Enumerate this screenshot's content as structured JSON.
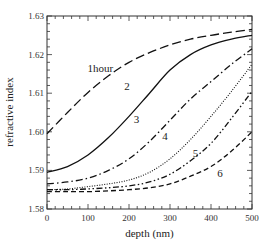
{
  "chart_data": {
    "type": "line",
    "title": "",
    "xlabel": "depth (nm)",
    "ylabel": "refractive index",
    "xlim": [
      0,
      500
    ],
    "ylim": [
      1.58,
      1.63
    ],
    "xticks": [
      0,
      100,
      200,
      300,
      400,
      500
    ],
    "yticks": [
      1.58,
      1.59,
      1.6,
      1.61,
      1.62,
      1.63
    ],
    "ytick_labels": [
      "1.58",
      "1.59",
      "1.60",
      "1.61",
      "1.62",
      "1.63"
    ],
    "xtick_labels": [
      "0",
      "100",
      "200",
      "300",
      "400",
      "500"
    ],
    "grid": false,
    "legend": "inline curve labels",
    "x": [
      0,
      50,
      100,
      150,
      200,
      250,
      300,
      350,
      400,
      450,
      500
    ],
    "series": [
      {
        "name": "1hour",
        "label": "1hour",
        "style": "long-dash",
        "values": [
          1.5995,
          1.605,
          1.6102,
          1.6145,
          1.618,
          1.6205,
          1.6225,
          1.624,
          1.625,
          1.6258,
          1.6265
        ]
      },
      {
        "name": "2",
        "label": "2",
        "style": "solid",
        "values": [
          1.5895,
          1.591,
          1.594,
          1.5985,
          1.604,
          1.61,
          1.616,
          1.62,
          1.6225,
          1.624,
          1.625
        ]
      },
      {
        "name": "3",
        "label": "3",
        "style": "dash-dot",
        "values": [
          1.5865,
          1.587,
          1.588,
          1.59,
          1.593,
          1.5975,
          1.603,
          1.6085,
          1.613,
          1.6175,
          1.6215
        ]
      },
      {
        "name": "4",
        "label": "4",
        "style": "dotted",
        "values": [
          1.585,
          1.5852,
          1.5858,
          1.5865,
          1.5875,
          1.5895,
          1.593,
          1.598,
          1.604,
          1.6105,
          1.6175
        ]
      },
      {
        "name": "5",
        "label": "5",
        "style": "dash-dot-dot",
        "values": [
          1.585,
          1.585,
          1.5852,
          1.5855,
          1.586,
          1.587,
          1.589,
          1.5925,
          1.597,
          1.6035,
          1.6105
        ]
      },
      {
        "name": "6",
        "label": "6",
        "style": "short-dash",
        "values": [
          1.5845,
          1.5845,
          1.5845,
          1.5847,
          1.585,
          1.5855,
          1.5865,
          1.5885,
          1.591,
          1.595,
          1.6
        ]
      }
    ],
    "annotations": [
      {
        "text": "1hour",
        "x": 130,
        "y": 1.6155
      },
      {
        "text": "2",
        "x": 195,
        "y": 1.6108
      },
      {
        "text": "3",
        "x": 218,
        "y": 1.6023
      },
      {
        "text": "4",
        "x": 288,
        "y": 1.598
      },
      {
        "text": "5",
        "x": 362,
        "y": 1.5935
      },
      {
        "text": "6",
        "x": 422,
        "y": 1.5883
      }
    ]
  }
}
